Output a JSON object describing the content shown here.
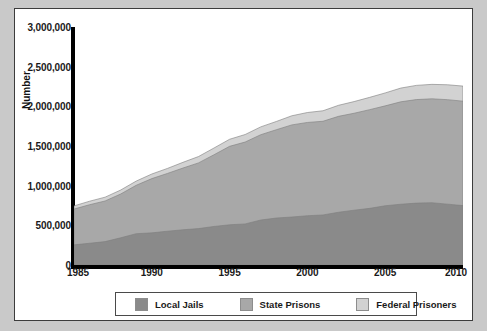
{
  "figure": {
    "background": "#ffffff",
    "outer_background": "#c9c9c9",
    "border_color": "#3c3c3c"
  },
  "axes": {
    "y_title": "Number",
    "y_ticks": [
      "0",
      "500,000",
      "1,000,000",
      "1,500,000",
      "2,000,000",
      "2,500,000",
      "3,000,000"
    ],
    "x_ticks": [
      "1985",
      "1990",
      "1995",
      "2000",
      "2005",
      "2010"
    ]
  },
  "legend": {
    "items": [
      {
        "label": "Local Jails",
        "color": "#8a8a8a"
      },
      {
        "label": "State Prisons",
        "color": "#a8a8a8"
      },
      {
        "label": "Federal Prisoners",
        "color": "#d2d2d2"
      }
    ]
  },
  "chart_data": {
    "type": "area",
    "stacked": true,
    "title": "",
    "xlabel": "",
    "ylabel": "Number",
    "xlim": [
      1985,
      2010
    ],
    "ylim": [
      0,
      3000000
    ],
    "grid": false,
    "legend_position": "bottom",
    "x": [
      1985,
      1986,
      1987,
      1988,
      1989,
      1990,
      1991,
      1992,
      1993,
      1994,
      1995,
      1996,
      1997,
      1998,
      1999,
      2000,
      2001,
      2002,
      2003,
      2004,
      2005,
      2006,
      2007,
      2008,
      2009,
      2010
    ],
    "series": [
      {
        "name": "Local Jails",
        "color": "#8a8a8a",
        "values": [
          254000,
          274000,
          295000,
          343000,
          395000,
          405000,
          426000,
          444000,
          459000,
          486000,
          507000,
          518000,
          567000,
          592000,
          605000,
          621000,
          631000,
          665000,
          691000,
          714000,
          747000,
          766000,
          780000,
          785000,
          767000,
          749000
        ]
      },
      {
        "name": "State Prisons",
        "color": "#a8a8a8",
        "values": [
          451000,
          486000,
          512000,
          552000,
          610000,
          684000,
          728000,
          778000,
          828000,
          904000,
          989000,
          1032000,
          1075000,
          1113000,
          1161000,
          1176000,
          1181000,
          1209000,
          1222000,
          1244000,
          1259000,
          1291000,
          1305000,
          1310000,
          1317000,
          1316000
        ]
      },
      {
        "name": "Federal Prisoners",
        "color": "#d2d2d2",
        "values": [
          40000,
          44000,
          48000,
          50000,
          53000,
          58000,
          63000,
          72000,
          80000,
          85000,
          89000,
          95000,
          99000,
          104000,
          115000,
          125000,
          132000,
          139000,
          147000,
          155000,
          163000,
          173000,
          179000,
          182000,
          188000,
          190000
        ]
      }
    ],
    "totals_note": {
      "start_year": 1985,
      "start_total": 745000,
      "end_year": 2010,
      "end_total": 2255000
    }
  }
}
